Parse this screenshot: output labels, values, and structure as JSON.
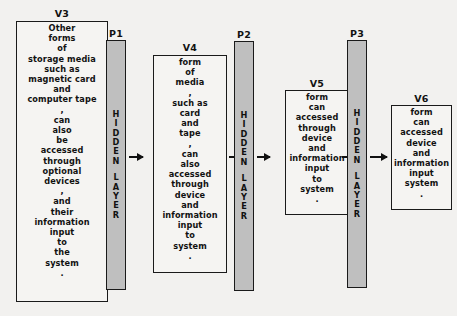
{
  "diagram": {
    "title": "",
    "type": "neural-network-flow-diagram",
    "colors": {
      "background": "#f2f1ef",
      "node_fill": "#f5f4f2",
      "hidden_fill": "#bfbfbf",
      "stroke": "#1a1a1a",
      "text": "#111111"
    },
    "nodes": [
      {
        "id": "v3",
        "label": "V3",
        "kind": "input",
        "lines": [
          "Other",
          "forms",
          "of",
          "storage media",
          "such as",
          "magnetic card",
          "and",
          "computer tape",
          ",",
          "can",
          "also",
          "be",
          "accessed",
          "through",
          "optional",
          "devices",
          ",",
          "and",
          "their",
          "information",
          "input",
          "to",
          "the",
          "system",
          "."
        ]
      },
      {
        "id": "p1",
        "label": "P1",
        "kind": "hidden",
        "word_top": "HIDDEN",
        "word_bottom": "LAYER"
      },
      {
        "id": "v4",
        "label": "V4",
        "kind": "input",
        "lines": [
          "form",
          "of",
          "media",
          ",",
          "such as",
          "card",
          "and",
          "tape",
          ",",
          "can",
          "also",
          "accessed",
          "through",
          "device",
          "and",
          "information",
          "input",
          "to",
          "system",
          "."
        ]
      },
      {
        "id": "p2",
        "label": "P2",
        "kind": "hidden",
        "word_top": "HIDDEN",
        "word_bottom": "LAYER"
      },
      {
        "id": "v5",
        "label": "V5",
        "kind": "input",
        "lines": [
          "form",
          "can",
          "accessed",
          "through",
          "device",
          "and",
          "information",
          "input",
          "to",
          "system",
          "."
        ]
      },
      {
        "id": "p3",
        "label": "P3",
        "kind": "hidden",
        "word_top": "HIDDEN",
        "word_bottom": "LAYER"
      },
      {
        "id": "v6",
        "label": "V6",
        "kind": "output",
        "lines": [
          "form",
          "can",
          "accessed",
          "device",
          "and",
          "information",
          "input",
          "system",
          "."
        ]
      }
    ],
    "connections": [
      {
        "from": "v3",
        "to": "p1"
      },
      {
        "from": "p1",
        "to": "v4"
      },
      {
        "from": "v4",
        "to": "p2"
      },
      {
        "from": "p2",
        "to": "v5"
      },
      {
        "from": "v5",
        "to": "p3"
      },
      {
        "from": "p3",
        "to": "v6"
      }
    ]
  }
}
